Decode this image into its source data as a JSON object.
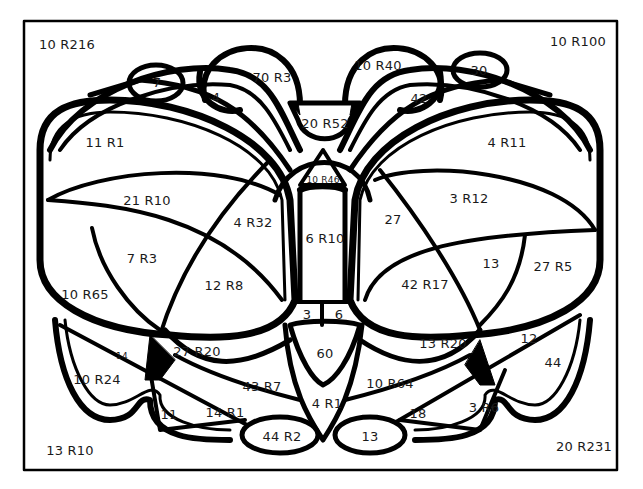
{
  "colors": {
    "line": "#000000",
    "background": "#ffffff",
    "text": "#1a1a1a"
  },
  "labels": [
    {
      "text": "10 R216",
      "x": 67,
      "y": 44,
      "size": "normal"
    },
    {
      "text": "10 R100",
      "x": 578,
      "y": 41,
      "size": "normal"
    },
    {
      "text": "7",
      "x": 157,
      "y": 82,
      "size": "normal"
    },
    {
      "text": "4",
      "x": 216,
      "y": 97,
      "size": "normal"
    },
    {
      "text": "70 R3",
      "x": 272,
      "y": 77,
      "size": "normal"
    },
    {
      "text": "10 R40",
      "x": 378,
      "y": 65,
      "size": "normal"
    },
    {
      "text": "30",
      "x": 479,
      "y": 70,
      "size": "normal"
    },
    {
      "text": "42",
      "x": 419,
      "y": 98,
      "size": "normal"
    },
    {
      "text": "20 R52",
      "x": 325,
      "y": 123,
      "size": "normal"
    },
    {
      "text": "11 R1",
      "x": 105,
      "y": 142,
      "size": "normal"
    },
    {
      "text": "4 R11",
      "x": 507,
      "y": 142,
      "size": "normal"
    },
    {
      "text": "10 R46",
      "x": 323,
      "y": 180,
      "size": "small"
    },
    {
      "text": "21 R10",
      "x": 147,
      "y": 200,
      "size": "normal"
    },
    {
      "text": "3 R12",
      "x": 469,
      "y": 198,
      "size": "normal"
    },
    {
      "text": "4 R32",
      "x": 253,
      "y": 222,
      "size": "normal"
    },
    {
      "text": "27",
      "x": 393,
      "y": 219,
      "size": "normal"
    },
    {
      "text": "6 R10",
      "x": 325,
      "y": 238,
      "size": "normal"
    },
    {
      "text": "7 R3",
      "x": 142,
      "y": 258,
      "size": "normal"
    },
    {
      "text": "13",
      "x": 491,
      "y": 263,
      "size": "normal"
    },
    {
      "text": "27 R5",
      "x": 553,
      "y": 266,
      "size": "normal"
    },
    {
      "text": "10 R65",
      "x": 85,
      "y": 294,
      "size": "normal"
    },
    {
      "text": "12 R8",
      "x": 224,
      "y": 285,
      "size": "normal"
    },
    {
      "text": "42 R17",
      "x": 425,
      "y": 284,
      "size": "normal"
    },
    {
      "text": "3",
      "x": 307,
      "y": 314,
      "size": "normal"
    },
    {
      "text": "6",
      "x": 339,
      "y": 314,
      "size": "normal"
    },
    {
      "text": "14",
      "x": 122,
      "y": 356,
      "size": "small"
    },
    {
      "text": "27 R20",
      "x": 197,
      "y": 351,
      "size": "normal"
    },
    {
      "text": "60",
      "x": 325,
      "y": 353,
      "size": "normal"
    },
    {
      "text": "13 R20",
      "x": 443,
      "y": 343,
      "size": "normal"
    },
    {
      "text": "12",
      "x": 529,
      "y": 338,
      "size": "normal"
    },
    {
      "text": "44",
      "x": 553,
      "y": 362,
      "size": "normal"
    },
    {
      "text": "10 R24",
      "x": 97,
      "y": 379,
      "size": "normal"
    },
    {
      "text": "43 R7",
      "x": 262,
      "y": 386,
      "size": "normal"
    },
    {
      "text": "10 R64",
      "x": 390,
      "y": 383,
      "size": "normal"
    },
    {
      "text": "4 R1",
      "x": 327,
      "y": 403,
      "size": "normal"
    },
    {
      "text": "11",
      "x": 169,
      "y": 414,
      "size": "normal"
    },
    {
      "text": "14 R1",
      "x": 225,
      "y": 412,
      "size": "normal"
    },
    {
      "text": "18",
      "x": 418,
      "y": 413,
      "size": "normal"
    },
    {
      "text": "3 R6",
      "x": 484,
      "y": 407,
      "size": "normal"
    },
    {
      "text": "44 R2",
      "x": 282,
      "y": 436,
      "size": "normal"
    },
    {
      "text": "13",
      "x": 370,
      "y": 436,
      "size": "normal"
    },
    {
      "text": "13 R10",
      "x": 70,
      "y": 450,
      "size": "normal"
    },
    {
      "text": "20 R231",
      "x": 584,
      "y": 446,
      "size": "normal"
    }
  ]
}
